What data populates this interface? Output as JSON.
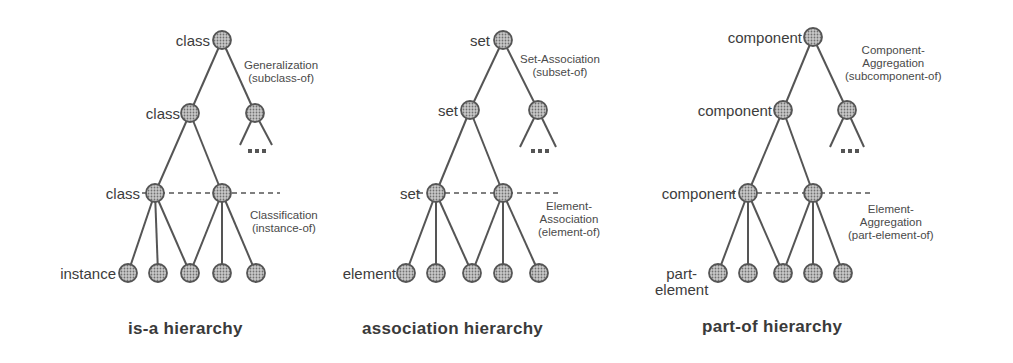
{
  "panels": [
    {
      "title": "is-a hierarchy",
      "root_label": "class",
      "level2_label": "class",
      "level3_label": "class",
      "leaf_label": "instance",
      "upper_relation": [
        "Generalization",
        "(subclass-of)"
      ],
      "lower_relation": [
        "Classification",
        "(instance-of)"
      ],
      "ellipsis": "..."
    },
    {
      "title": "association hierarchy",
      "root_label": "set",
      "level2_label": "set",
      "level3_label": "set",
      "leaf_label": "element",
      "upper_relation": [
        "Set-Association",
        "(subset-of)"
      ],
      "lower_relation": [
        "Element-",
        "Association",
        "(element-of)"
      ],
      "ellipsis": "..."
    },
    {
      "title": "part-of hierarchy",
      "root_label": "component",
      "level2_label": "component",
      "level3_label": "component",
      "leaf_label": [
        "part-",
        "element"
      ],
      "upper_relation": [
        "Component-",
        "Aggregation",
        "(subcomponent-of)"
      ],
      "lower_relation": [
        "Element-",
        "Aggregation",
        "(part-element-of)"
      ],
      "ellipsis": "..."
    }
  ],
  "colors": {
    "node_fill": "#9a9a9a",
    "node_stroke": "#555555",
    "edge": "#555555",
    "text": "#3c3c3c"
  }
}
